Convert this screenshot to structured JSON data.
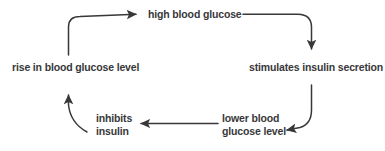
{
  "diagram": {
    "background_color": "#ffffff",
    "line_color": "#38373a",
    "text_color": "#38373a",
    "nodes": [
      {
        "id": "high-blood-glucose",
        "label": "high blood glucose"
      },
      {
        "id": "stimulates-insulin-secretion",
        "label": "stimulates insulin secretion"
      },
      {
        "id": "lower-blood-glucose-level",
        "label": "lower blood\nglucose level"
      },
      {
        "id": "inhibits-insulin",
        "label": "inhibits\ninsulin"
      },
      {
        "id": "rise-in-blood-glucose-level",
        "label": "rise in blood glucose level"
      }
    ],
    "connections": [
      {
        "id": "arrow-high-to-stimulates",
        "from": "high-blood-glucose",
        "to": "stimulates-insulin-secretion"
      },
      {
        "id": "arrow-stimulates-to-lower",
        "from": "stimulates-insulin-secretion",
        "to": "lower-blood-glucose-level"
      },
      {
        "id": "arrow-lower-to-inhibits",
        "from": "lower-blood-glucose-level",
        "to": "inhibits-insulin"
      },
      {
        "id": "arrow-inhibits-to-rise",
        "from": "inhibits-insulin",
        "to": "rise-in-blood-glucose-level"
      },
      {
        "id": "arrow-rise-to-high",
        "from": "rise-in-blood-glucose-level",
        "to": "high-blood-glucose"
      }
    ]
  }
}
